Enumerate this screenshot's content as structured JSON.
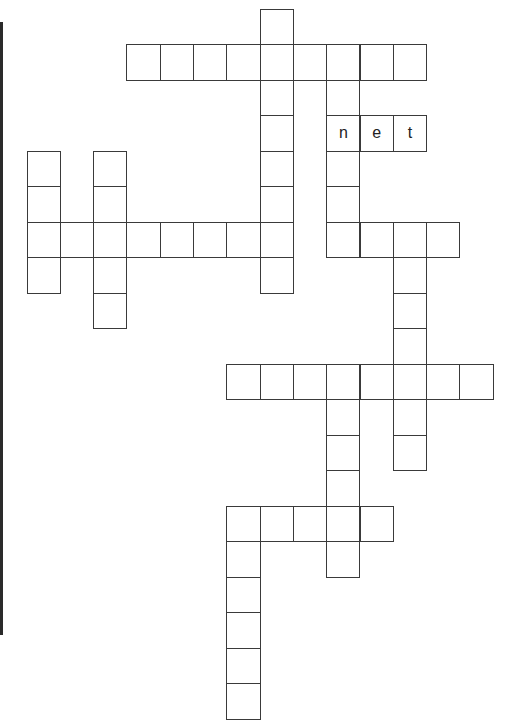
{
  "puzzle": {
    "type": "crossword",
    "grid": {
      "origin_x": 27,
      "origin_y": 9,
      "cell_w": 33.3,
      "cell_h": 35.5
    },
    "entries": [
      {
        "id": "down-col7",
        "direction": "down",
        "row": 0,
        "col": 7,
        "length": 8
      },
      {
        "id": "across-row1",
        "direction": "across",
        "row": 1,
        "col": 3,
        "length": 9
      },
      {
        "id": "down-col9-top",
        "direction": "down",
        "row": 1,
        "col": 9,
        "length": 6
      },
      {
        "id": "across-row3",
        "direction": "across",
        "row": 3,
        "col": 9,
        "length": 3,
        "letters": [
          "n",
          "e",
          "t"
        ]
      },
      {
        "id": "down-col0",
        "direction": "down",
        "row": 4,
        "col": 0,
        "length": 4
      },
      {
        "id": "down-col2",
        "direction": "down",
        "row": 4,
        "col": 2,
        "length": 5
      },
      {
        "id": "across-row6-left",
        "direction": "across",
        "row": 6,
        "col": 0,
        "length": 8
      },
      {
        "id": "across-row6-right",
        "direction": "across",
        "row": 6,
        "col": 9,
        "length": 4
      },
      {
        "id": "down-col11",
        "direction": "down",
        "row": 6,
        "col": 11,
        "length": 7
      },
      {
        "id": "across-row10",
        "direction": "across",
        "row": 10,
        "col": 6,
        "length": 8
      },
      {
        "id": "down-col9-bottom",
        "direction": "down",
        "row": 10,
        "col": 9,
        "length": 6
      },
      {
        "id": "across-row14",
        "direction": "across",
        "row": 14,
        "col": 6,
        "length": 5
      },
      {
        "id": "down-col6",
        "direction": "down",
        "row": 14,
        "col": 6,
        "length": 6
      }
    ]
  }
}
